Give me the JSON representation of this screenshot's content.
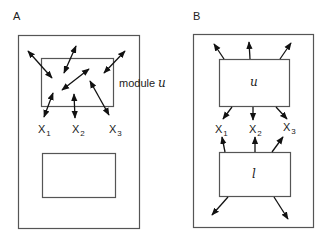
{
  "panels": {
    "A": {
      "label": "A",
      "modules": {
        "upper": {
          "text": "module",
          "var": "u"
        },
        "lower": {
          "text": "module",
          "var": "l"
        }
      },
      "variables": [
        {
          "base": "X",
          "sub": "1"
        },
        {
          "base": "X",
          "sub": "2"
        },
        {
          "base": "X",
          "sub": "3"
        }
      ],
      "arrow_style": "bidirectional"
    },
    "B": {
      "label": "B",
      "modules": {
        "upper": {
          "var": "u"
        },
        "lower": {
          "var": "l"
        }
      },
      "variables": [
        {
          "base": "X",
          "sub": "1"
        },
        {
          "base": "X",
          "sub": "2"
        },
        {
          "base": "X",
          "sub": "3"
        }
      ],
      "arrow_style": "unidirectional-outward"
    }
  },
  "colors": {
    "stroke": "#111111",
    "box": "#555555",
    "background": "#ffffff"
  }
}
